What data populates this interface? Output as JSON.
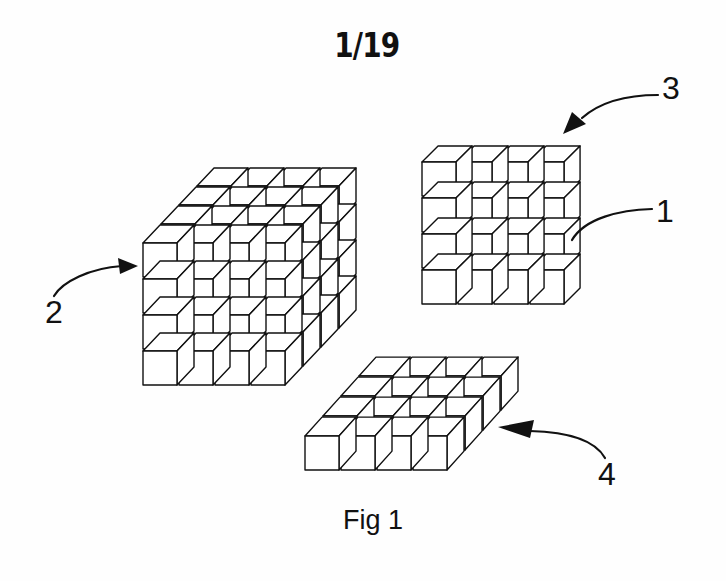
{
  "page": {
    "sheet_number": "1/19",
    "caption": "Fig 1"
  },
  "figure": {
    "assemblies": [
      {
        "id": "cube-block",
        "reference": "2",
        "description": "4 x 4 x 4 cubic assembly of unit cubes",
        "cols": 4,
        "rows": 4,
        "depth": 4,
        "origin": [
          143,
          243
        ],
        "cell": 36,
        "gap": 2,
        "depth_step": [
          18,
          -19
        ]
      },
      {
        "id": "vertical-panel",
        "reference": "3",
        "description": "4 x 4 x 1 upright layer of unit cubes",
        "cols": 4,
        "rows": 4,
        "depth": 1,
        "origin": [
          422,
          162
        ],
        "cell": 36,
        "gap": 2,
        "depth_step": [
          17,
          -17
        ]
      },
      {
        "id": "horizontal-panel",
        "reference": "4",
        "description": "4 x 1 x 4 flat layer of unit cubes",
        "cols": 4,
        "rows": 1,
        "depth": 4,
        "origin": [
          305,
          436
        ],
        "cell": 36,
        "gap": 2,
        "depth_step": [
          18,
          -20
        ]
      }
    ],
    "reference_labels": [
      {
        "id": "label-1",
        "text": "1",
        "points_to": "single unit cube in vertical panel",
        "pos": [
          656,
          195
        ]
      },
      {
        "id": "label-2",
        "text": "2",
        "points_to": "cube-block",
        "pos": [
          45,
          296
        ]
      },
      {
        "id": "label-3",
        "text": "3",
        "points_to": "vertical-panel",
        "pos": [
          662,
          72
        ]
      },
      {
        "id": "label-4",
        "text": "4",
        "points_to": "horizontal-panel",
        "pos": [
          598,
          458
        ]
      }
    ],
    "leaders": [
      {
        "id": "leader-1",
        "path": "M 652 209 C 620 210, 585 218, 572 240",
        "arrow": false
      },
      {
        "id": "leader-2",
        "path": "M 54 296 C 62 282, 90 268, 122 266",
        "arrow": [
          [
            138,
            266
          ],
          [
            118,
            258
          ],
          [
            120,
            274
          ]
        ]
      },
      {
        "id": "leader-3",
        "path": "M 658 95 C 625 95, 600 102, 582 118",
        "arrow": [
          [
            563,
            134
          ],
          [
            572,
            112
          ],
          [
            586,
            124
          ]
        ]
      },
      {
        "id": "leader-4",
        "path": "M 605 458 C 595 440, 570 432, 530 431",
        "arrow": [
          [
            498,
            427
          ],
          [
            534,
            420
          ],
          [
            530,
            438
          ]
        ]
      }
    ]
  }
}
